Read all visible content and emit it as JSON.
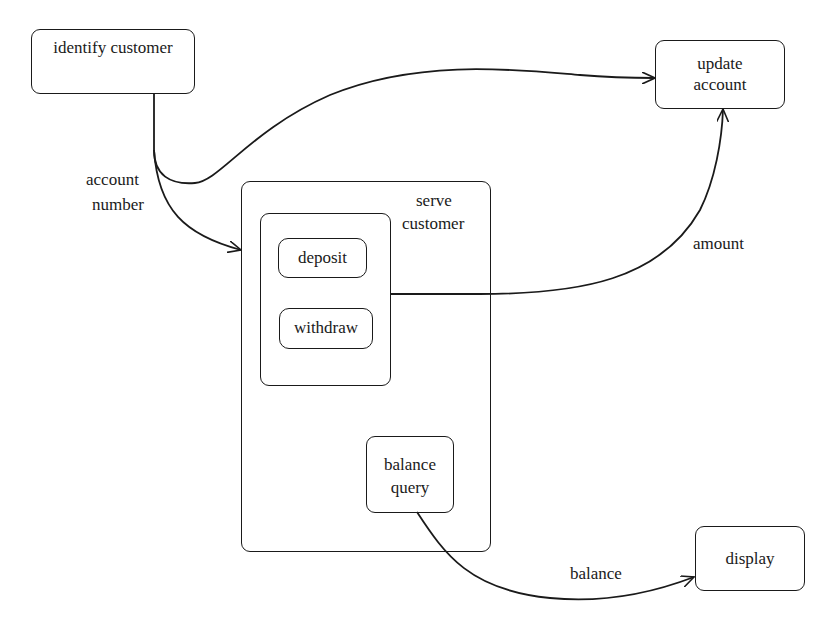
{
  "diagram": {
    "type": "statechart / process diagram",
    "nodes": {
      "identify_customer": {
        "label": "identify customer"
      },
      "update_account": {
        "line1": "update",
        "line2": "account"
      },
      "serve_customer": {
        "line1": "serve",
        "line2": "customer"
      },
      "deposit": {
        "label": "deposit"
      },
      "withdraw": {
        "label": "withdraw"
      },
      "balance_query": {
        "line1": "balance",
        "line2": "query"
      },
      "display": {
        "label": "display"
      }
    },
    "edges": {
      "account_number": {
        "line1": "account",
        "line2": "number",
        "from": "identify customer",
        "to": "serve customer"
      },
      "identify_to_update": {
        "from": "identify customer",
        "to": "update account"
      },
      "amount": {
        "label": "amount",
        "from": "deposit/withdraw group",
        "to": "update account"
      },
      "balance": {
        "label": "balance",
        "from": "balance query",
        "to": "display"
      }
    },
    "colors": {
      "stroke": "#1a1a1a",
      "background": "#ffffff"
    }
  }
}
